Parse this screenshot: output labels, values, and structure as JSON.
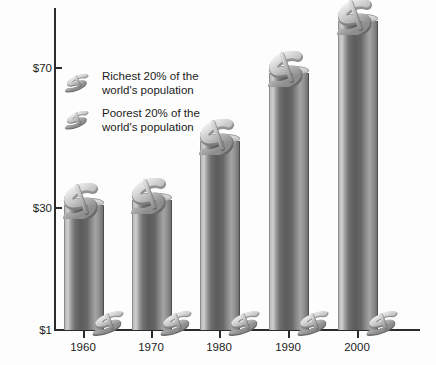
{
  "chart_data": {
    "type": "bar",
    "title": "",
    "subtitle": "",
    "xlabel": "",
    "ylabel": "",
    "categories": [
      "1960",
      "1970",
      "1980",
      "1990",
      "2000"
    ],
    "series": [
      {
        "name": "Richest 20% of the world's population",
        "values": [
          30,
          32,
          45,
          60,
          74
        ]
      },
      {
        "name": "Poorest 20% of the world's population",
        "values": [
          1,
          1,
          1,
          1,
          1
        ]
      }
    ],
    "ytick_labels": [
      "$70",
      "$30",
      "$1"
    ],
    "ytick_values": [
      70,
      30,
      1
    ],
    "ylim": [
      1,
      78
    ],
    "grid": false,
    "legend_position": "upper-left"
  },
  "axes": {
    "y_ticks": [
      {
        "label": "$70",
        "value": 70,
        "y": 68
      },
      {
        "label": "$30",
        "value": 30,
        "y": 208
      },
      {
        "label": "$1",
        "value": 1,
        "y": 330
      }
    ],
    "x_ticks": [
      {
        "label": "1960",
        "x": 83
      },
      {
        "label": "1970",
        "x": 151
      },
      {
        "label": "1980",
        "x": 219
      },
      {
        "label": "1990",
        "x": 288
      },
      {
        "label": "2000",
        "x": 357
      }
    ]
  },
  "bars": [
    {
      "category": "1960",
      "value": 30,
      "left": 64,
      "top": 205,
      "height": 125
    },
    {
      "category": "1970",
      "value": 32,
      "left": 132,
      "top": 200,
      "height": 130
    },
    {
      "category": "1980",
      "value": 45,
      "left": 200,
      "top": 141,
      "height": 189
    },
    {
      "category": "1990",
      "value": 60,
      "left": 269,
      "top": 73,
      "height": 257
    },
    {
      "category": "2000",
      "value": 74,
      "left": 338,
      "top": 21,
      "height": 309
    }
  ],
  "legend": {
    "items": [
      {
        "icon": "dollar-sign-3d-icon",
        "line1": "Richest 20% of the",
        "line2": "world's population"
      },
      {
        "icon": "dollar-sign-3d-icon",
        "line1": "Poorest 20% of the",
        "line2": "world's population"
      }
    ]
  },
  "colors": {
    "background": "#fdfdfd",
    "axis": "#2b2b2b",
    "text": "#1c1c1c",
    "bar_light": "#cfcfcf",
    "bar_mid": "#8a8a8a",
    "bar_dark": "#5c5c5c",
    "ornament_light": "#e6e6e6",
    "ornament_dark": "#7a7a7a"
  }
}
